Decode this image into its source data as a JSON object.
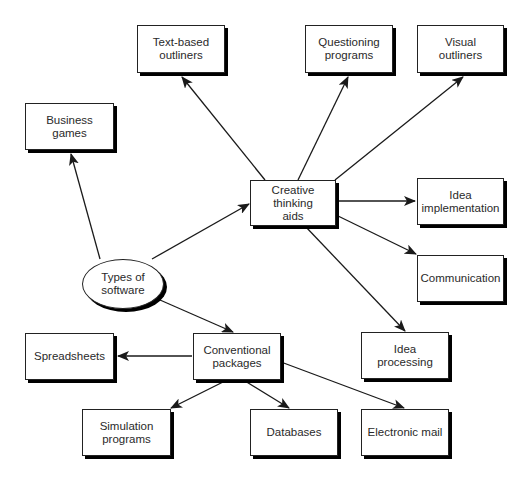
{
  "diagram": {
    "type": "concept-map",
    "root": {
      "id": "types",
      "label": "Types of\nsoftware"
    },
    "nodes": [
      {
        "id": "text_outliners",
        "label": "Text-based\noutliners"
      },
      {
        "id": "questioning",
        "label": "Questioning\nprograms"
      },
      {
        "id": "visual_outliners",
        "label": "Visual outliners"
      },
      {
        "id": "business_games",
        "label": "Business games"
      },
      {
        "id": "creative",
        "label": "Creative thinking\naids"
      },
      {
        "id": "idea_impl",
        "label": "Idea\nimplementation"
      },
      {
        "id": "communication",
        "label": "Communication"
      },
      {
        "id": "spreadsheets",
        "label": "Spreadsheets"
      },
      {
        "id": "conventional",
        "label": "Conventional\npackages"
      },
      {
        "id": "idea_processing",
        "label": "Idea processing"
      },
      {
        "id": "simulation",
        "label": "Simulation\nprograms"
      },
      {
        "id": "databases",
        "label": "Databases"
      },
      {
        "id": "email",
        "label": "Electronic mail"
      }
    ],
    "edges": [
      {
        "from": "types",
        "to": "business_games"
      },
      {
        "from": "types",
        "to": "creative"
      },
      {
        "from": "types",
        "to": "conventional"
      },
      {
        "from": "creative",
        "to": "text_outliners"
      },
      {
        "from": "creative",
        "to": "questioning"
      },
      {
        "from": "creative",
        "to": "visual_outliners"
      },
      {
        "from": "creative",
        "to": "idea_impl"
      },
      {
        "from": "creative",
        "to": "communication"
      },
      {
        "from": "creative",
        "to": "idea_processing"
      },
      {
        "from": "conventional",
        "to": "spreadsheets"
      },
      {
        "from": "conventional",
        "to": "simulation"
      },
      {
        "from": "conventional",
        "to": "databases"
      },
      {
        "from": "conventional",
        "to": "email"
      }
    ]
  },
  "labels": {
    "types": "Types of\nsoftware",
    "text_outliners": "Text-based\noutliners",
    "questioning": "Questioning\nprograms",
    "visual_outliners": "Visual outliners",
    "business_games": "Business games",
    "creative": "Creative thinking\naids",
    "idea_impl": "Idea\nimplementation",
    "communication": "Communication",
    "spreadsheets": "Spreadsheets",
    "conventional": "Conventional\npackages",
    "idea_processing": "Idea processing",
    "simulation": "Simulation\nprograms",
    "databases": "Databases",
    "email": "Electronic mail"
  },
  "colors": {
    "line": "#1a1a1a",
    "shadow": "#000000",
    "background": "#ffffff"
  }
}
